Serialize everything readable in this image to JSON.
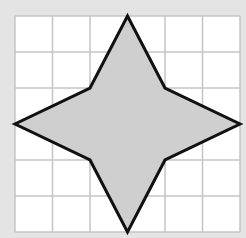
{
  "diagram": {
    "type": "grid-shape",
    "background_color": "#e4e4e4",
    "grid": {
      "columns": 6,
      "rows": 6,
      "left": 15,
      "top": 16,
      "width": 225,
      "height": 216,
      "line_color": "#c4c4c4",
      "fill_color": "#ffffff"
    },
    "shape": {
      "name": "four-pointed star",
      "fill_color": "#cfcfcf",
      "stroke_color": "#111111",
      "stroke_width": 3,
      "vertices_grid_units": [
        [
          3,
          0
        ],
        [
          4,
          2
        ],
        [
          6,
          3
        ],
        [
          4,
          4
        ],
        [
          3,
          6
        ],
        [
          2,
          4
        ],
        [
          0,
          3
        ],
        [
          2,
          2
        ]
      ]
    }
  }
}
